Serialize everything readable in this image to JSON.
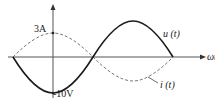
{
  "diagram": {
    "type": "sinusoidal waveforms",
    "x_axis_label": "ωt",
    "labels": {
      "current_peak": "3A",
      "voltage_min": "-10V",
      "voltage_curve": "u (t)",
      "current_curve": "i (t)"
    },
    "series": [
      {
        "name": "u(t)",
        "style": "solid",
        "amplitude": 10,
        "unit": "V",
        "description": "starts at zero, dips to -10V at axis, crosses zero, peaks positive"
      },
      {
        "name": "i(t)",
        "style": "dashed",
        "amplitude": 3,
        "unit": "A",
        "description": "peak 3A at vertical axis, leads/lags voltage by 90 degrees"
      }
    ],
    "colors": {
      "curve": "#1a1a1a",
      "axis": "#555555",
      "dashed": "#777777"
    }
  }
}
